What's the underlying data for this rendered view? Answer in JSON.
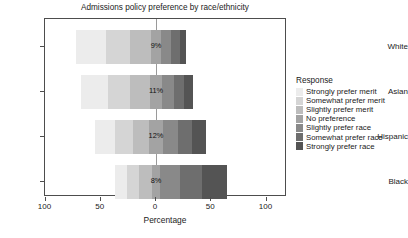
{
  "chart_data": {
    "type": "bar",
    "subtype": "diverging-stacked-likert",
    "title": "Admissions policy preference by race/ethnicity",
    "xlabel": "Percentage",
    "ylabel": "",
    "xlim": [
      -110,
      110
    ],
    "xticks": [
      100,
      50,
      0,
      50,
      100
    ],
    "xticklabels": [
      "100",
      "50",
      "0",
      "50",
      "100"
    ],
    "grid": false,
    "legend_position": "right",
    "legend_title": "Response",
    "categories": [
      "White",
      "Asian",
      "Hispanic",
      "Black"
    ],
    "series": [
      {
        "name": "Strongly prefer merit",
        "color": "#ececec",
        "values": [
          27,
          24,
          18,
          11
        ]
      },
      {
        "name": "Somewhat prefer merit",
        "color": "#d5d5d5",
        "values": [
          22,
          20,
          16,
          11
        ]
      },
      {
        "name": "Slightly prefer merit",
        "color": "#bdbdbd",
        "values": [
          19,
          18,
          15,
          11
        ]
      },
      {
        "name": "No preference",
        "color": "#a3a3a3",
        "values": [
          9,
          11,
          12,
          8
        ]
      },
      {
        "name": "Slightly prefer race",
        "color": "#898989",
        "values": [
          9,
          11,
          14,
          18
        ]
      },
      {
        "name": "Somewhat prefer race",
        "color": "#6e6e6e",
        "values": [
          8,
          9,
          13,
          20
        ]
      },
      {
        "name": "Strongly prefer race",
        "color": "#545454",
        "values": [
          6,
          8,
          12,
          22
        ]
      }
    ],
    "left_totals": [
      "68%",
      "62%",
      "49%",
      "33%"
    ],
    "center_labels": [
      "9%",
      "11%",
      "12%",
      "8%"
    ],
    "right_totals": [
      "23%",
      "28%",
      "39%",
      "60%"
    ]
  },
  "axis": {
    "y_labels": [
      "White",
      "Asian",
      "Hispanic",
      "Black"
    ]
  },
  "colors": {
    "panel_border": "#4d4d4d",
    "zero_line": "#9a9a9a",
    "text": "#1a1a1a",
    "background": "#ffffff"
  }
}
